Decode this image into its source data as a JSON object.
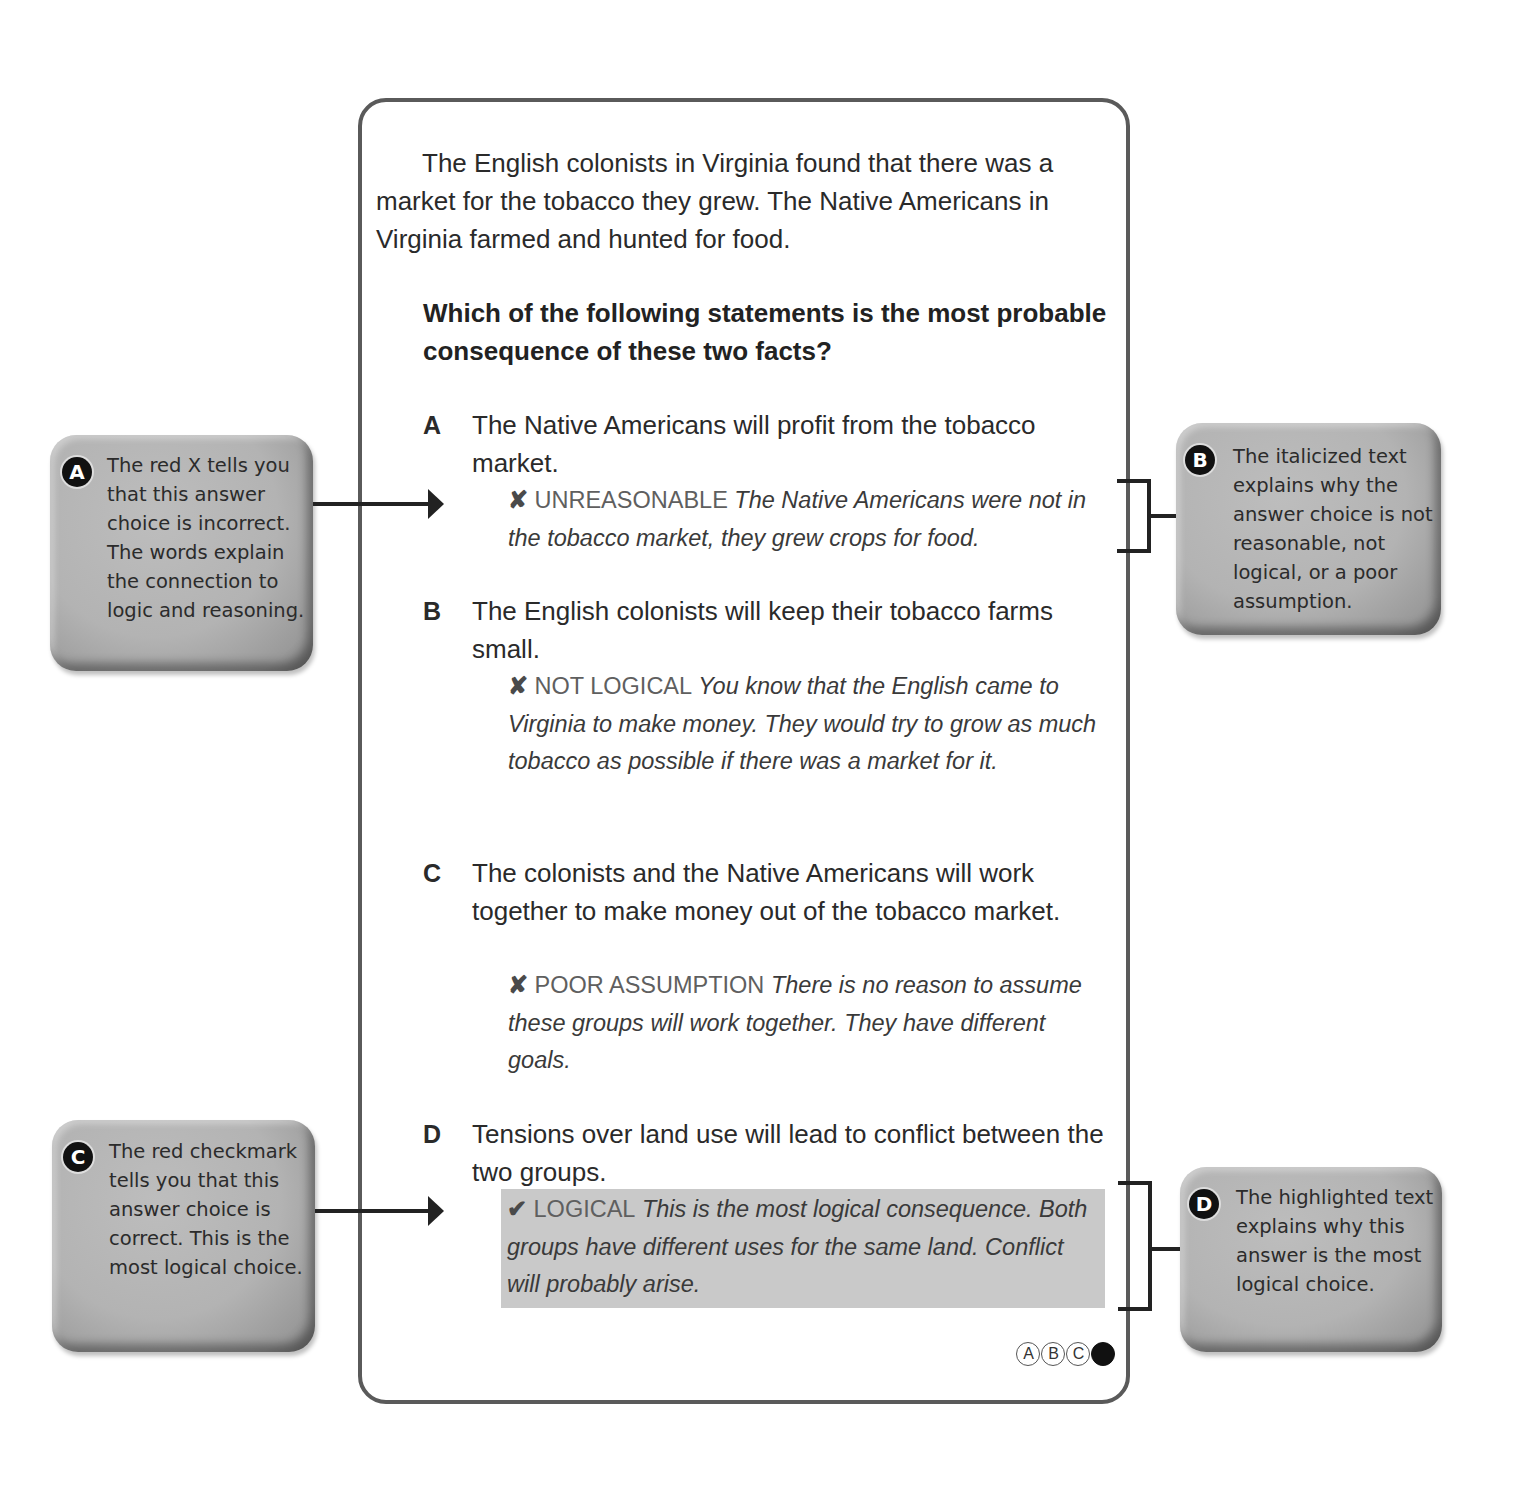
{
  "passage": "The English colonists in Virginia found that there was a market for the tobacco they grew. The Native Americans in Virginia farmed and hunted for food.",
  "question": "Which of the following statements is the most probable consequence of these two facts?",
  "options": [
    {
      "letter": "A",
      "text": "The Native Americans will profit from the tobacco market.",
      "mark_icon": "x-mark-icon",
      "mark": "✘",
      "tag": "UNREASONABLE",
      "explanation": "The Native Americans were not in the tobacco market, they grew crops for food.",
      "correct": false
    },
    {
      "letter": "B",
      "text": "The English colonists will keep their tobacco farms small.",
      "mark_icon": "x-mark-icon",
      "mark": "✘",
      "tag": "NOT LOGICAL",
      "explanation": "You know that the English came to Virginia to make money. They would try to grow as much tobacco as possible if there was a market for it.",
      "correct": false
    },
    {
      "letter": "C",
      "text": "The colonists and the Native Americans will work together to make money out of the tobacco market.",
      "mark_icon": "x-mark-icon",
      "mark": "✘",
      "tag": "POOR ASSUMPTION",
      "explanation": "There is no reason to assume these groups will work together. They have different goals.",
      "correct": false
    },
    {
      "letter": "D",
      "text": "Tensions over land use will lead to conflict between the two groups.",
      "mark_icon": "checkmark-icon",
      "mark": "✔",
      "tag": "LOGICAL",
      "explanation": "This is the most logical consequence. Both groups have different uses for the same land. Conflict will probably arise.",
      "correct": true
    }
  ],
  "answer_bubbles": [
    {
      "label": "A",
      "filled": false
    },
    {
      "label": "B",
      "filled": false
    },
    {
      "label": "C",
      "filled": false
    },
    {
      "label": "",
      "filled": true
    }
  ],
  "callouts": [
    {
      "badge": "A",
      "text": "The red X tells you that this answer choice is incorrect. The words explain the connection to logic and reasoning."
    },
    {
      "badge": "B",
      "text": "The italicized text explains why the answer choice is not reasonable, not logical, or a poor assumption."
    },
    {
      "badge": "C",
      "text": "The red checkmark tells you that this answer choice is correct. This is the most logical choice."
    },
    {
      "badge": "D",
      "text": "The highlighted text explains why this answer is the most logical choice."
    }
  ],
  "colors": {
    "card_border": "#5a5a5a",
    "highlight": "#c9c9c9",
    "callout_bg": "#b3b3b3",
    "badge": "#111111"
  }
}
